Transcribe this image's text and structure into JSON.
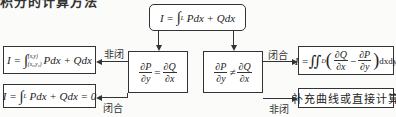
{
  "title_partial": "积分的计算方法",
  "top_box": {
    "formula": "I = ∫_L Pdx + Qdx",
    "lhs": "I =",
    "integral": "∫",
    "sub": "L",
    "rhs": "Pdx + Qdx"
  },
  "middle_left_box": {
    "condition": "∂P/∂y = ∂Q/∂x",
    "num1": "∂P",
    "den1": "∂y",
    "op": "=",
    "num2": "∂Q",
    "den2": "∂x"
  },
  "middle_right_box": {
    "condition": "∂P/∂y ≠ ∂Q/∂x",
    "num1": "∂P",
    "den1": "∂y",
    "op": "≠",
    "num2": "∂Q",
    "den2": "∂x"
  },
  "left_top_box": {
    "formula": "I = ∫_(x0,y0)^(x,y) Pdx + Qdx",
    "lhs": "I =",
    "integral": "∫",
    "upper": "(x,y)",
    "lower": "(x₀,y₀)",
    "rhs": "Pdx + Qdx"
  },
  "left_bottom_box": {
    "formula": "I = ∫_L Pdx + Qdx = 0",
    "lhs": "I =",
    "integral": "∫",
    "sub": "L",
    "rhs": "Pdx + Qdx = 0"
  },
  "right_top_box": {
    "formula": "I = ∬_D (∂Q/∂x − ∂P/∂y) dxdy",
    "lhs": "I =",
    "integral": "∬",
    "sub": "D",
    "num1": "∂Q",
    "den1": "∂x",
    "op": "−",
    "num2": "∂P",
    "den2": "∂y",
    "tail": "dxdy"
  },
  "right_bottom_box": {
    "text": "补充曲线或直接计算"
  },
  "edge_labels": {
    "left_top": "非闭",
    "left_bottom": "闭合",
    "right_top": "闭合",
    "right_bottom": "非闭"
  }
}
